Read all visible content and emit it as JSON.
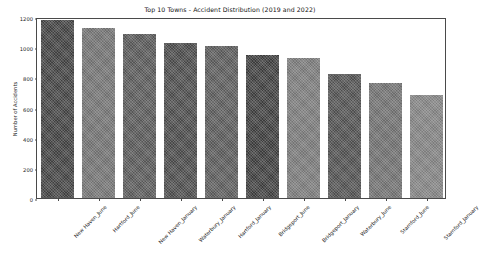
{
  "chart_data": {
    "type": "bar",
    "title": "Top 10 Towns - Accident Distribution (2019 and 2022)",
    "xlabel": "",
    "ylabel": "Number of Accidents",
    "categories": [
      "New Haven_June",
      "Hartford_June",
      "New Haven_January",
      "Waterbury_January",
      "Hartford_January",
      "Bridgeport_June",
      "Bridgeport_January",
      "Waterbury_June",
      "Stamford_June",
      "Stamford_January"
    ],
    "values": [
      1180,
      1125,
      1090,
      1030,
      1010,
      945,
      930,
      825,
      765,
      680
    ],
    "bar_colors": [
      "#3f3f3f",
      "#6e6e6e",
      "#555555",
      "#484848",
      "#575757",
      "#3b3b3b",
      "#757575",
      "#4d4d4d",
      "#6b6b6b",
      "#7d7d7d"
    ],
    "ylim": [
      0,
      1200
    ],
    "yticks": [
      0,
      200,
      400,
      600,
      800,
      1000,
      1200
    ],
    "ytick_labels": [
      "0",
      "200",
      "400",
      "600",
      "800",
      "1000",
      "1200"
    ],
    "grid": false,
    "legend": null,
    "xtick_rotation": -45
  }
}
